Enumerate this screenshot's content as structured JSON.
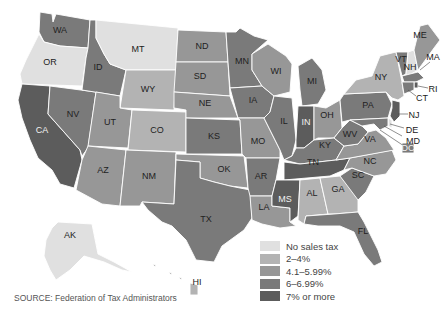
{
  "map": {
    "title": "State sales tax rates",
    "colors": {
      "none": "#e0e0e0",
      "low": "#b3b3b3",
      "mid": "#979797",
      "high": "#7a7a7a",
      "top": "#5c5c5c"
    },
    "states": {
      "WA": {
        "label": "WA",
        "bin": "high"
      },
      "OR": {
        "label": "OR",
        "bin": "none"
      },
      "CA": {
        "label": "CA",
        "bin": "top"
      },
      "NV": {
        "label": "NV",
        "bin": "high"
      },
      "ID": {
        "label": "ID",
        "bin": "high"
      },
      "MT": {
        "label": "MT",
        "bin": "none"
      },
      "WY": {
        "label": "WY",
        "bin": "low"
      },
      "UT": {
        "label": "UT",
        "bin": "mid"
      },
      "CO": {
        "label": "CO",
        "bin": "low"
      },
      "AZ": {
        "label": "AZ",
        "bin": "mid"
      },
      "NM": {
        "label": "NM",
        "bin": "mid"
      },
      "ND": {
        "label": "ND",
        "bin": "mid"
      },
      "SD": {
        "label": "SD",
        "bin": "mid"
      },
      "NE": {
        "label": "NE",
        "bin": "mid"
      },
      "KS": {
        "label": "KS",
        "bin": "high"
      },
      "OK": {
        "label": "OK",
        "bin": "mid"
      },
      "TX": {
        "label": "TX",
        "bin": "high"
      },
      "MN": {
        "label": "MN",
        "bin": "high"
      },
      "IA": {
        "label": "IA",
        "bin": "high"
      },
      "MO": {
        "label": "MO",
        "bin": "mid"
      },
      "AR": {
        "label": "AR",
        "bin": "high"
      },
      "LA": {
        "label": "LA",
        "bin": "mid"
      },
      "WI": {
        "label": "WI",
        "bin": "mid"
      },
      "IL": {
        "label": "IL",
        "bin": "high"
      },
      "MI": {
        "label": "MI",
        "bin": "high"
      },
      "IN": {
        "label": "IN",
        "bin": "top"
      },
      "OH": {
        "label": "OH",
        "bin": "mid"
      },
      "KY": {
        "label": "KY",
        "bin": "high"
      },
      "TN": {
        "label": "TN",
        "bin": "top"
      },
      "MS": {
        "label": "MS",
        "bin": "top"
      },
      "AL": {
        "label": "AL",
        "bin": "low"
      },
      "GA": {
        "label": "GA",
        "bin": "low"
      },
      "FL": {
        "label": "FL",
        "bin": "high"
      },
      "SC": {
        "label": "SC",
        "bin": "high"
      },
      "NC": {
        "label": "NC",
        "bin": "mid"
      },
      "VA": {
        "label": "VA",
        "bin": "mid"
      },
      "WV": {
        "label": "WV",
        "bin": "high"
      },
      "PA": {
        "label": "PA",
        "bin": "high"
      },
      "NY": {
        "label": "NY",
        "bin": "low"
      },
      "VT": {
        "label": "VT",
        "bin": "high"
      },
      "NH": {
        "label": "NH",
        "bin": "none"
      },
      "ME": {
        "label": "ME",
        "bin": "mid"
      },
      "MA": {
        "label": "MA",
        "bin": "high"
      },
      "RI": {
        "label": "RI",
        "bin": "top"
      },
      "CT": {
        "label": "CT",
        "bin": "high"
      },
      "NJ": {
        "label": "NJ",
        "bin": "top"
      },
      "DE": {
        "label": "DE",
        "bin": "none"
      },
      "MD": {
        "label": "MD",
        "bin": "high"
      },
      "DC": {
        "label": "DC",
        "bin": "high"
      },
      "AK": {
        "label": "AK",
        "bin": "none"
      },
      "HI": {
        "label": "HI",
        "bin": "low"
      }
    }
  },
  "legend": {
    "items": [
      {
        "label": "No sales tax",
        "color": "#e0e0e0"
      },
      {
        "label": "2–4%",
        "color": "#b3b3b3"
      },
      {
        "label": "4.1–5.99%",
        "color": "#979797"
      },
      {
        "label": "6–6.99%",
        "color": "#7a7a7a"
      },
      {
        "label": "7% or more",
        "color": "#5c5c5c"
      }
    ]
  },
  "source": "SOURCE: Federation of Tax Administrators"
}
